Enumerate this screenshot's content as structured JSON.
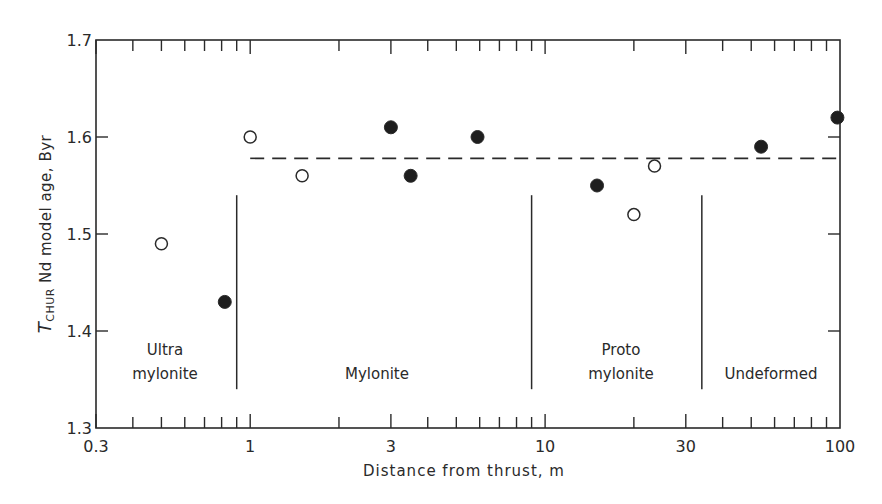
{
  "chart_data": {
    "type": "scatter",
    "title": "",
    "xlabel": "Distance from thrust, m",
    "ylabel": "T_CHUR Nd model age, Byr",
    "ylabel_parts": {
      "symbol": "T",
      "subscript": "CHUR",
      "rest": "Nd model age, Byr"
    },
    "xscale": "log",
    "xlim": [
      0.3,
      100
    ],
    "ylim": [
      1.3,
      1.7
    ],
    "x_ticks": [
      0.3,
      1,
      3,
      10,
      30,
      100
    ],
    "x_tick_labels": [
      "0.3",
      "1",
      "3",
      "10",
      "30",
      "100"
    ],
    "y_ticks": [
      1.3,
      1.4,
      1.5,
      1.6,
      1.7
    ],
    "y_tick_labels": [
      "1.3",
      "1.4",
      "1.5",
      "1.6",
      "1.7"
    ],
    "grid": false,
    "legend": null,
    "series": [
      {
        "name": "open circles",
        "marker": "open-circle",
        "points": [
          {
            "x": 0.5,
            "y": 1.49
          },
          {
            "x": 1.0,
            "y": 1.6
          },
          {
            "x": 1.5,
            "y": 1.56
          },
          {
            "x": 20,
            "y": 1.52
          },
          {
            "x": 23.5,
            "y": 1.57
          }
        ]
      },
      {
        "name": "filled circles",
        "marker": "filled-circle",
        "points": [
          {
            "x": 0.82,
            "y": 1.43
          },
          {
            "x": 3.0,
            "y": 1.61
          },
          {
            "x": 3.5,
            "y": 1.56
          },
          {
            "x": 5.9,
            "y": 1.6
          },
          {
            "x": 15,
            "y": 1.55
          },
          {
            "x": 54,
            "y": 1.59
          },
          {
            "x": 98,
            "y": 1.62
          }
        ]
      }
    ],
    "reference_line": {
      "style": "dashed",
      "y": 1.578,
      "x_start": 1.0,
      "x_end": 100
    },
    "zone_dividers": [
      {
        "x": 0.9,
        "y_top": 1.54,
        "y_bottom": 1.34
      },
      {
        "x": 9.0,
        "y_top": 1.54,
        "y_bottom": 1.34
      },
      {
        "x": 34,
        "y_top": 1.54,
        "y_bottom": 1.34
      }
    ],
    "zones": [
      {
        "lines": [
          "Ultra",
          "mylonite"
        ]
      },
      {
        "lines": [
          "Mylonite"
        ]
      },
      {
        "lines": [
          "Proto",
          "mylonite"
        ]
      },
      {
        "lines": [
          "Undeformed"
        ]
      }
    ]
  }
}
